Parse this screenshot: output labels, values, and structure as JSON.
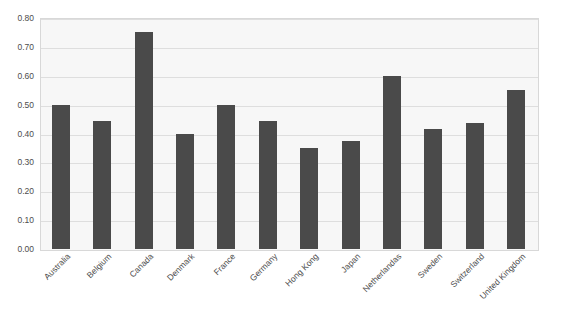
{
  "chart_data": {
    "type": "bar",
    "title": "",
    "subtitle": "",
    "xlabel": "",
    "ylabel": "",
    "ylim": [
      0.0,
      0.8
    ],
    "ytick_labels": [
      "0.80",
      "0.70",
      "0.60",
      "0.50",
      "0.40",
      "0.30",
      "0.20",
      "0.10",
      "0.00"
    ],
    "ytick_values": [
      0.8,
      0.7,
      0.6,
      0.5,
      0.4,
      0.3,
      0.2,
      0.1,
      0.0
    ],
    "grid": true,
    "legend": "none",
    "bar_color": "#4a4a4a",
    "plot_background": "#f7f7f7",
    "gridline_color": "#dedede",
    "categories": [
      "Australia",
      "Belgium",
      "Canada",
      "Denmark",
      "France",
      "Germany",
      "Hong Kong",
      "Japan",
      "Netherlandas",
      "Sweden",
      "Switzerland",
      "United Kingdom"
    ],
    "values": [
      0.5,
      0.445,
      0.75,
      0.4,
      0.5,
      0.445,
      0.35,
      0.375,
      0.6,
      0.415,
      0.435,
      0.55
    ]
  }
}
